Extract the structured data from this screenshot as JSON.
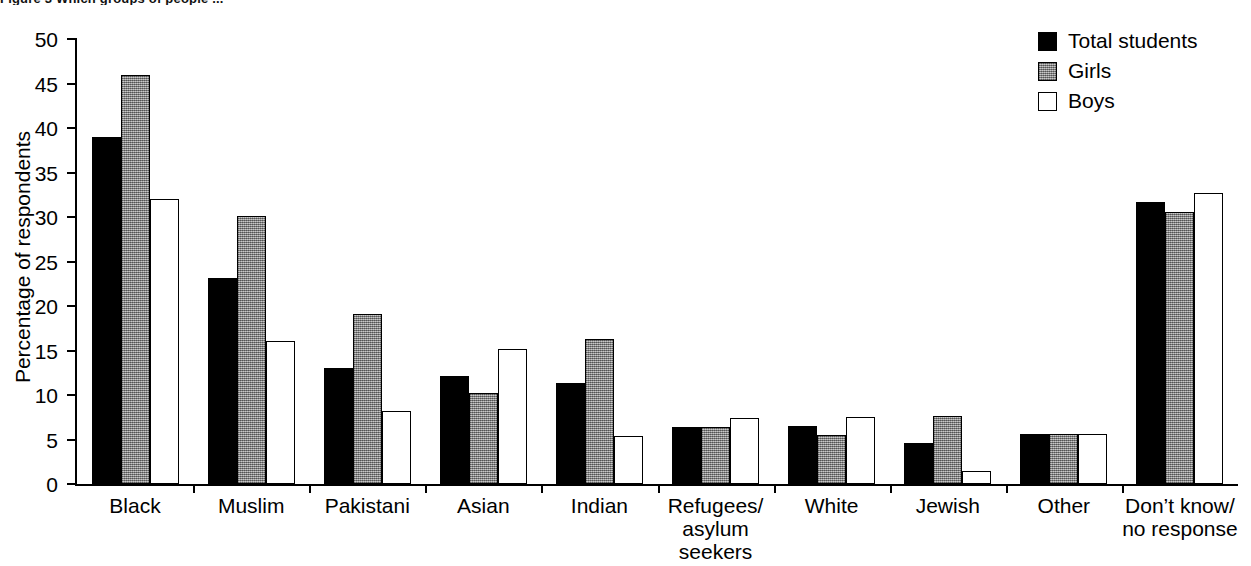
{
  "figure": {
    "title_clipped": "Figure 3  Which groups of people ..."
  },
  "legend": {
    "position": "top-right",
    "entries": [
      {
        "label": "Total students",
        "swatch": "black-filled-square-icon",
        "color": "#000000"
      },
      {
        "label": "Girls",
        "swatch": "grey-hatched-square-icon",
        "color": "#9a9a9a"
      },
      {
        "label": "Boys",
        "swatch": "white-outline-square-icon",
        "color": "#ffffff"
      }
    ]
  },
  "axes": {
    "y_title": "Percentage of respondents",
    "y_ticks": [
      "0",
      "5",
      "10",
      "15",
      "20",
      "25",
      "30",
      "35",
      "40",
      "45",
      "50"
    ]
  },
  "chart_data": {
    "type": "bar",
    "title": "Figure 3  Which groups of people ...",
    "xlabel": "",
    "ylabel": "Percentage of respondents",
    "ylim": [
      0,
      50
    ],
    "ytick_step": 5,
    "grid": false,
    "legend_position": "top-right",
    "categories": [
      "Black",
      "Muslim",
      "Pakistani",
      "Asian",
      "Indian",
      "Refugees/\nasylum\nseekers",
      "White",
      "Jewish",
      "Other",
      "Don’t know/\nno response"
    ],
    "series": [
      {
        "name": "Total students",
        "color": "#000000",
        "values": [
          39.0,
          23.1,
          13.0,
          12.1,
          11.3,
          6.4,
          6.5,
          4.6,
          5.6,
          31.7
        ]
      },
      {
        "name": "Girls",
        "color": "#9a9a9a",
        "values": [
          46.0,
          30.1,
          19.1,
          10.2,
          16.3,
          6.4,
          5.5,
          7.6,
          5.6,
          30.6
        ]
      },
      {
        "name": "Boys",
        "color": "#ffffff",
        "values": [
          32.0,
          16.1,
          8.2,
          15.2,
          5.4,
          7.4,
          7.5,
          1.5,
          5.6,
          32.7
        ]
      }
    ]
  }
}
